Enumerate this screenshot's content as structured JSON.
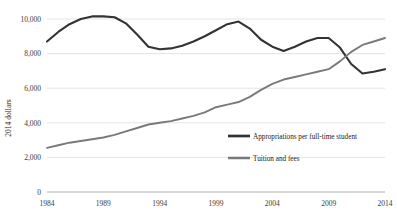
{
  "chart_data": {
    "type": "line",
    "title": "",
    "subtitle": "",
    "xlabel": "",
    "ylabel": "2014 dollars",
    "xlim": [
      1984,
      2014
    ],
    "ylim": [
      0,
      10000
    ],
    "grid": true,
    "legend_position": "inside-center-right",
    "x_ticks": [
      "1984",
      "1989",
      "1994",
      "1999",
      "2004",
      "2009",
      "2014"
    ],
    "x_tick_values": [
      1984,
      1989,
      1994,
      1999,
      2004,
      2009,
      2014
    ],
    "y_ticks": [
      "0",
      "2,000",
      "4,000",
      "6,000",
      "8,000",
      "10,000"
    ],
    "y_tick_values": [
      0,
      2000,
      4000,
      6000,
      8000,
      10000
    ],
    "x": [
      1984,
      1985,
      1986,
      1987,
      1988,
      1989,
      1990,
      1991,
      1992,
      1993,
      1994,
      1995,
      1996,
      1997,
      1998,
      1999,
      2000,
      2001,
      2002,
      2003,
      2004,
      2005,
      2006,
      2007,
      2008,
      2009,
      2010,
      2011,
      2012,
      2013,
      2014
    ],
    "series": [
      {
        "name": "Appropriations per full-time student",
        "color": "#333333",
        "width": 2.1,
        "values": [
          8700,
          9250,
          9700,
          10000,
          10150,
          10150,
          10100,
          9750,
          9100,
          8400,
          8250,
          8300,
          8450,
          8700,
          9000,
          9350,
          9700,
          9850,
          9450,
          8800,
          8400,
          8150,
          8400,
          8700,
          8900,
          8900,
          8350,
          7400,
          6850,
          6950,
          7100
        ]
      },
      {
        "name": "Tuition and fees",
        "color": "#7a7a7a",
        "width": 1.9,
        "values": [
          2550,
          2700,
          2850,
          2950,
          3050,
          3150,
          3300,
          3500,
          3700,
          3900,
          4000,
          4100,
          4250,
          4400,
          4600,
          4900,
          5050,
          5200,
          5500,
          5900,
          6250,
          6500,
          6650,
          6800,
          6950,
          7100,
          7550,
          8100,
          8500,
          8700,
          8900
        ]
      }
    ],
    "legend": [
      {
        "label": "Appropriations per full-time student",
        "color": "#333333"
      },
      {
        "label": "Tuition and fees",
        "color": "#7a7a7a"
      }
    ]
  }
}
